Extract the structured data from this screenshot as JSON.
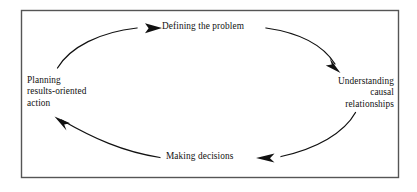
{
  "diagram": {
    "type": "cycle",
    "orientation": "clockwise",
    "border_color": "#555555",
    "background_color": "#ffffff",
    "stroke_color": "#111111",
    "text_color": "#111111",
    "nodes": [
      {
        "id": "defining-the-problem",
        "position": "top",
        "lines": [
          "Defining the problem"
        ],
        "text": "Defining the problem"
      },
      {
        "id": "understanding-causal-relationships",
        "position": "right",
        "lines": [
          "Understanding",
          "causal",
          "relationships"
        ],
        "text": "Understanding causal relationships"
      },
      {
        "id": "making-decisions",
        "position": "bottom",
        "lines": [
          "Making decisions"
        ],
        "text": "Making decisions"
      },
      {
        "id": "planning-results-oriented-action",
        "position": "left",
        "lines": [
          "Planning",
          "results-oriented",
          "action"
        ],
        "text": "Planning results-oriented action"
      }
    ],
    "arrows": [
      {
        "id": "arrow-top-right",
        "from": "defining-the-problem",
        "to": "understanding-causal-relationships",
        "direction": "down-right"
      },
      {
        "id": "arrow-bottom-right",
        "from": "understanding-causal-relationships",
        "to": "making-decisions",
        "direction": "left"
      },
      {
        "id": "arrow-bottom-left",
        "from": "making-decisions",
        "to": "planning-results-oriented-action",
        "direction": "up-left"
      },
      {
        "id": "arrow-top-left",
        "from": "planning-results-oriented-action",
        "to": "defining-the-problem",
        "direction": "right"
      }
    ]
  }
}
